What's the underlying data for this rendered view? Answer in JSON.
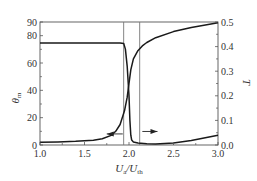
{
  "chart_data": {
    "type": "line",
    "title": "",
    "xlabel": "U_a/U_th",
    "xlabel_main": "U",
    "xlabel_sub1": "a",
    "xlabel_slash": "/U",
    "xlabel_sub2": "th",
    "ylabel_left": "θm",
    "ylabel_left_main": "θ",
    "ylabel_left_sub": "m",
    "ylabel_right": "T",
    "xlim": [
      1.0,
      3.0
    ],
    "ylim_left": [
      0,
      90
    ],
    "ylim_right": [
      0.0,
      0.5
    ],
    "x_ticks": [
      "1.0",
      "1.5",
      "2.0",
      "2.5",
      "3.0"
    ],
    "x_tick_values": [
      1.0,
      1.5,
      2.0,
      2.5,
      3.0
    ],
    "y_left_ticks": [
      "0",
      "20",
      "40",
      "60",
      "80",
      "90"
    ],
    "y_left_tick_values": [
      0,
      20,
      40,
      60,
      80,
      90
    ],
    "y_right_ticks": [
      "0.0",
      "0.1",
      "0.2",
      "0.3",
      "0.4",
      "0.5"
    ],
    "y_right_tick_values": [
      0.0,
      0.1,
      0.2,
      0.3,
      0.4,
      0.5
    ],
    "grid": false,
    "vertical_lines": [
      1.94,
      2.12
    ],
    "series": [
      {
        "name": "θm",
        "axis": "left",
        "arrow": "left",
        "x": [
          1.0,
          1.2,
          1.4,
          1.6,
          1.7,
          1.8,
          1.85,
          1.9,
          1.95,
          1.98,
          2.0,
          2.02,
          2.05,
          2.1,
          2.15,
          2.2,
          2.3,
          2.5,
          2.7,
          3.0
        ],
        "values": [
          2,
          2.3,
          2.7,
          3.5,
          4.5,
          7,
          10,
          15,
          25,
          35,
          45,
          55,
          63,
          69,
          72.5,
          75,
          78.5,
          83,
          86,
          89.5
        ]
      },
      {
        "name": "T",
        "axis": "right",
        "arrow": "right",
        "x": [
          1.0,
          1.5,
          1.9,
          1.94,
          1.96,
          1.98,
          2.0,
          2.01,
          2.02,
          2.03,
          2.05,
          2.1,
          2.2,
          2.3,
          2.5,
          2.7,
          2.9,
          3.0
        ],
        "values": [
          0.415,
          0.415,
          0.415,
          0.413,
          0.39,
          0.32,
          0.2,
          0.1,
          0.04,
          0.02,
          0.012,
          0.008,
          0.005,
          0.004,
          0.008,
          0.018,
          0.032,
          0.04
        ]
      }
    ],
    "arrows": [
      {
        "target_series": "θm",
        "direction": "left",
        "x_from": 1.93,
        "x_to": 1.75,
        "y_right": 0.045
      },
      {
        "target_series": "T",
        "direction": "right",
        "x_from": 2.15,
        "x_to": 2.32,
        "y_right": 0.055
      }
    ],
    "legend": null
  }
}
